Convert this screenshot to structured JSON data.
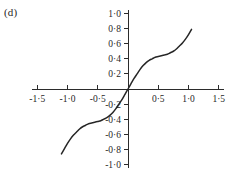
{
  "figure": {
    "panel_label": "(d)",
    "background_color": "#ffffff",
    "curve_color": "#262626",
    "axis_color": "#2b2b2b"
  },
  "chart_data": {
    "type": "line",
    "title": "",
    "subtitle": "",
    "xlabel": "",
    "ylabel": "",
    "xlim": [
      -1.6,
      1.6
    ],
    "ylim": [
      -1.05,
      1.05
    ],
    "grid": false,
    "legend": null,
    "axes_cross_at_origin": true,
    "decimal_separator": "middle-dot",
    "xticks": [
      -1.5,
      -1.0,
      -0.5,
      0.5,
      1.0,
      1.5
    ],
    "xtick_labels": [
      "-1·5",
      "-1·0",
      "-0·5",
      "0·5",
      "1·0",
      "1·5"
    ],
    "yticks": [
      1.0,
      0.8,
      0.6,
      0.4,
      0.2,
      -0.2,
      -0.4,
      -0.6,
      -0.8,
      -1.0
    ],
    "ytick_labels": [
      "1·0",
      "0·8",
      "0·6",
      "0·4",
      "0·2",
      "-0·2",
      "-0·4",
      "-0·6",
      "-0·8",
      "-1·0"
    ],
    "series": [
      {
        "name": "curve",
        "x": [
          -1.1,
          -1.05,
          -1.0,
          -0.95,
          -0.9,
          -0.85,
          -0.8,
          -0.75,
          -0.7,
          -0.65,
          -0.6,
          -0.55,
          -0.5,
          -0.45,
          -0.4,
          -0.35,
          -0.3,
          -0.25,
          -0.2,
          -0.15,
          -0.1,
          -0.05,
          0.0,
          0.05,
          0.1,
          0.15,
          0.2,
          0.25,
          0.3,
          0.35,
          0.4,
          0.45,
          0.5,
          0.55,
          0.6,
          0.65,
          0.7,
          0.75,
          0.8,
          0.85,
          0.9,
          0.95,
          1.0,
          1.05
        ],
        "y": [
          -0.86,
          -0.79,
          -0.72,
          -0.66,
          -0.61,
          -0.57,
          -0.53,
          -0.5,
          -0.48,
          -0.46,
          -0.45,
          -0.44,
          -0.43,
          -0.42,
          -0.4,
          -0.38,
          -0.35,
          -0.31,
          -0.26,
          -0.2,
          -0.14,
          -0.07,
          0.0,
          0.07,
          0.14,
          0.2,
          0.26,
          0.31,
          0.35,
          0.38,
          0.4,
          0.42,
          0.43,
          0.44,
          0.45,
          0.46,
          0.48,
          0.5,
          0.53,
          0.57,
          0.61,
          0.66,
          0.72,
          0.79
        ]
      }
    ]
  }
}
